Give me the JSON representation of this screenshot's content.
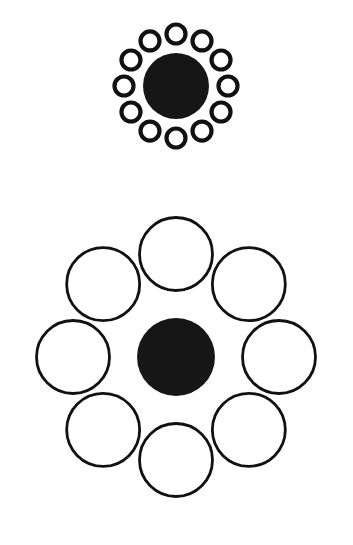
{
  "canvas": {
    "width": 353,
    "height": 545,
    "background_color": "#FFFFFF",
    "stroke_color": "#111111",
    "fill_color": "#161616"
  },
  "figure": {
    "name": "ebbinghaus-illusion",
    "type": "geometric-illusion-diagram",
    "panel_count": 2
  },
  "panels": [
    {
      "id": "top-panel",
      "name": "small-inducers-panel",
      "center": {
        "x": 176,
        "y": 86
      },
      "target": {
        "name": "center-disk-top",
        "shape": "filled-circle",
        "cx": 176,
        "cy": 86,
        "r": 33,
        "diameter": 66,
        "fill": "#161616",
        "stroke_width": 0
      },
      "inducers": {
        "name": "small-circle-ring",
        "shape": "outlined-circle",
        "count": 12,
        "ring_radius": 52,
        "circle_radius": 9.5,
        "circle_diameter": 19,
        "stroke_width": 4.2,
        "stroke": "#111111",
        "fill": "none",
        "start_angle_deg": -90,
        "angle_step_deg": 30,
        "angles_deg": [
          -90,
          -60,
          -30,
          0,
          30,
          60,
          90,
          120,
          150,
          180,
          210,
          240
        ]
      }
    },
    {
      "id": "bottom-panel",
      "name": "large-inducers-panel",
      "center": {
        "x": 176,
        "y": 357
      },
      "target": {
        "name": "center-disk-bottom",
        "shape": "filled-circle",
        "cx": 176,
        "cy": 357,
        "r": 39,
        "diameter": 78,
        "fill": "#161616",
        "stroke_width": 0
      },
      "inducers": {
        "name": "large-circle-ring",
        "shape": "outlined-circle",
        "count": 8,
        "ring_radius": 103,
        "circle_radius": 36.5,
        "circle_diameter": 73,
        "stroke_width": 2.8,
        "stroke": "#111111",
        "fill": "none",
        "start_angle_deg": -90,
        "angle_step_deg": 45,
        "angles_deg": [
          -90,
          -45,
          0,
          45,
          90,
          135,
          180,
          225
        ]
      }
    }
  ]
}
